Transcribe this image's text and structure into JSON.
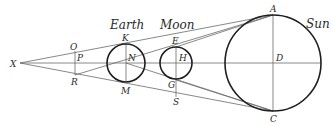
{
  "diagram": {
    "bodies": {
      "earth": "Earth",
      "moon": "Moon",
      "sun": "Sun"
    },
    "points": {
      "X": "X",
      "O": "O",
      "P": "P",
      "R": "R",
      "K": "K",
      "N": "N",
      "M": "M",
      "E": "E",
      "H": "H",
      "G": "G",
      "S": "S",
      "A": "A",
      "D": "D",
      "C": "C"
    }
  }
}
